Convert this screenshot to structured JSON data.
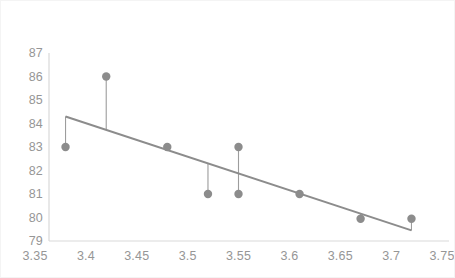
{
  "chart_data": {
    "type": "scatter",
    "title": "",
    "subtitle": "",
    "xlabel": "",
    "ylabel": "",
    "xlim": [
      3.35,
      3.75
    ],
    "ylim": [
      79,
      87
    ],
    "grid": false,
    "legend": null,
    "x_ticks": [
      "3.35",
      "3.4",
      "3.45",
      "3.5",
      "3.55",
      "3.6",
      "3.65",
      "3.7",
      "3.75"
    ],
    "x_tick_values": [
      3.35,
      3.4,
      3.45,
      3.5,
      3.55,
      3.6,
      3.65,
      3.7,
      3.75
    ],
    "y_ticks": [
      "87",
      "86",
      "85",
      "84",
      "83",
      "82",
      "81",
      "80",
      "79"
    ],
    "y_tick_values": [
      87,
      86,
      85,
      84,
      83,
      82,
      81,
      80,
      79
    ],
    "series": [
      {
        "name": "observations",
        "marker": "circle",
        "color": "#8c8c8c",
        "points": [
          {
            "x": 3.38,
            "y": 83
          },
          {
            "x": 3.42,
            "y": 86
          },
          {
            "x": 3.48,
            "y": 83
          },
          {
            "x": 3.52,
            "y": 81
          },
          {
            "x": 3.55,
            "y": 83
          },
          {
            "x": 3.55,
            "y": 81
          },
          {
            "x": 3.61,
            "y": 81
          },
          {
            "x": 3.67,
            "y": 79.95
          },
          {
            "x": 3.72,
            "y": 79.95
          }
        ]
      }
    ],
    "trendline": {
      "name": "regression-line",
      "color": "#8c8c8c",
      "x_start": 3.38,
      "y_start": 84.3,
      "x_end": 3.72,
      "y_end": 79.45
    },
    "residual_lines": [
      {
        "x": 3.38,
        "y_point": 83,
        "y_fit": 84.3
      },
      {
        "x": 3.42,
        "y_point": 86,
        "y_fit": 83.73
      },
      {
        "x": 3.48,
        "y_point": 83,
        "y_fit": 82.88
      },
      {
        "x": 3.52,
        "y_point": 81,
        "y_fit": 82.31
      },
      {
        "x": 3.55,
        "y_point": 83,
        "y_fit": 81.88
      },
      {
        "x": 3.55,
        "y_point": 81,
        "y_fit": 81.88
      },
      {
        "x": 3.61,
        "y_point": 81,
        "y_fit": 81.03
      },
      {
        "x": 3.67,
        "y_point": 79.95,
        "y_fit": 80.17
      },
      {
        "x": 3.72,
        "y_point": 79.95,
        "y_fit": 79.45
      }
    ],
    "axis_color": "#d9d9d9",
    "marker_radius": 4.2,
    "line_width": 2
  }
}
